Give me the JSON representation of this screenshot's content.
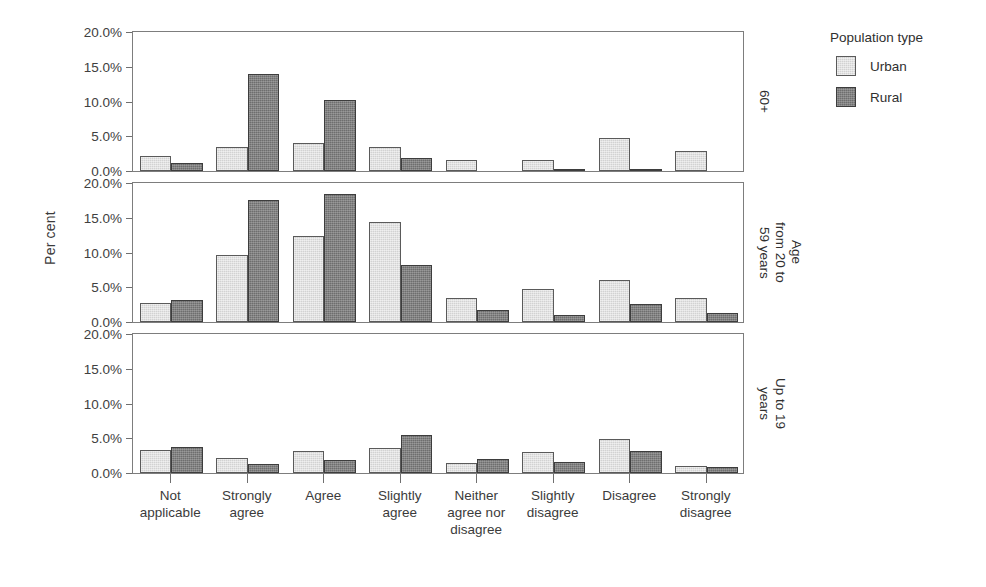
{
  "chart_data": {
    "type": "bar",
    "title": "",
    "xlabel": "",
    "ylabel": "Per cent",
    "ylim": [
      0,
      20
    ],
    "ytick_labels": [
      "0.0%",
      "5.0%",
      "10.0%",
      "15.0%",
      "20.0%"
    ],
    "ytick_values": [
      0,
      5,
      10,
      15,
      20
    ],
    "grid": false,
    "legend_position": "right",
    "legend_title": "Population type",
    "legend_entries": [
      "Urban",
      "Rural"
    ],
    "series_colors": {
      "Urban": "#d2d2d2",
      "Rural": "#6e6e6e"
    },
    "categories": [
      "Not\napplicable",
      "Strongly\nagree",
      "Agree",
      "Slightly\nagree",
      "Neither\nagree nor\ndisagree",
      "Slightly\ndisagree",
      "Disagree",
      "Strongly\ndisagree"
    ],
    "facet_variable": "Age",
    "facets": [
      {
        "name": "60+",
        "strip_label": "60+",
        "series": [
          {
            "name": "Urban",
            "values": [
              2.2,
              3.4,
              4.0,
              3.5,
              1.6,
              1.6,
              4.8,
              2.9
            ]
          },
          {
            "name": "Rural",
            "values": [
              1.2,
              14.0,
              10.2,
              1.9,
              0.0,
              0.2,
              0.3,
              0.0
            ]
          }
        ]
      },
      {
        "name": "Age from 20 to 59 years",
        "strip_label": "Age\nfrom 20 to\n59 years",
        "series": [
          {
            "name": "Urban",
            "values": [
              2.8,
              9.6,
              12.4,
              14.4,
              3.4,
              4.7,
              6.0,
              3.4
            ]
          },
          {
            "name": "Rural",
            "values": [
              3.1,
              17.5,
              18.4,
              8.2,
              1.8,
              1.0,
              2.6,
              1.3
            ]
          }
        ]
      },
      {
        "name": "Up to 19 years",
        "strip_label": "Up to 19\nyears",
        "series": [
          {
            "name": "Urban",
            "values": [
              3.3,
              2.1,
              3.1,
              3.6,
              1.5,
              3.0,
              4.9,
              1.0
            ]
          },
          {
            "name": "Rural",
            "values": [
              3.7,
              1.3,
              1.9,
              5.4,
              2.0,
              1.6,
              3.1,
              0.9
            ]
          }
        ]
      }
    ]
  },
  "axis": {
    "y_title": "Per cent"
  },
  "legend": {
    "title": "Population type",
    "items": [
      {
        "label": "Urban",
        "key": "urban"
      },
      {
        "label": "Rural",
        "key": "rural"
      }
    ]
  }
}
